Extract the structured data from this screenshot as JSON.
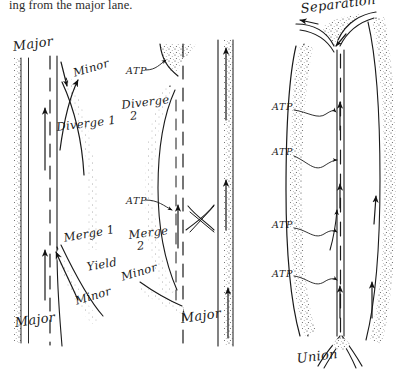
{
  "page": {
    "background_color": "#ffffff",
    "ink_color": "#1a1a1a",
    "caption_text": "ing from the major lane."
  },
  "figure": {
    "title_top_right": "Separation",
    "title_bottom_right": "Union",
    "panels": [
      {
        "id": "panel-left",
        "name": "diverge-merge-1",
        "labels": [
          {
            "name": "label-major-top",
            "text": "Major",
            "x": 12,
            "y": 40
          },
          {
            "name": "label-minor-top",
            "text": "Minor",
            "x": 72,
            "y": 68
          },
          {
            "name": "label-diverge-1",
            "text": "Diverge 1",
            "x": 56,
            "y": 122
          },
          {
            "name": "label-merge-1",
            "text": "Merge 1",
            "x": 63,
            "y": 233
          },
          {
            "name": "label-yield",
            "text": "Yield",
            "x": 86,
            "y": 262
          },
          {
            "name": "label-minor-bottom",
            "text": "Minor",
            "x": 74,
            "y": 296
          },
          {
            "name": "label-major-bottom",
            "text": "Major",
            "x": 14,
            "y": 316
          }
        ]
      },
      {
        "id": "panel-middle",
        "name": "diverge-merge-2",
        "labels": [
          {
            "name": "label-atp-top",
            "text": "ATP",
            "x": 126,
            "y": 66
          },
          {
            "name": "label-diverge-2",
            "text": "Diverge",
            "second_line": "2",
            "x": 121,
            "y": 100
          },
          {
            "name": "label-atp-middle",
            "text": "ATP",
            "x": 126,
            "y": 196
          },
          {
            "name": "label-merge-2",
            "text": "Merge",
            "second_line": "2",
            "x": 128,
            "y": 230
          },
          {
            "name": "label-minor-bottom",
            "text": "Minor",
            "x": 120,
            "y": 272
          },
          {
            "name": "label-major-bottom",
            "text": "Major",
            "x": 180,
            "y": 312
          }
        ]
      },
      {
        "id": "panel-right",
        "name": "separation-union",
        "labels": [
          {
            "name": "label-separation",
            "text": "Separation",
            "x": 300,
            "y": 2
          },
          {
            "name": "label-atp-1",
            "text": "ATP",
            "x": 272,
            "y": 102
          },
          {
            "name": "label-atp-2",
            "text": "ATP",
            "x": 272,
            "y": 147
          },
          {
            "name": "label-atp-3",
            "text": "ATP",
            "x": 272,
            "y": 220
          },
          {
            "name": "label-atp-4",
            "text": "ATP",
            "x": 272,
            "y": 269
          },
          {
            "name": "label-union",
            "text": "Union",
            "x": 296,
            "y": 352
          }
        ]
      }
    ]
  }
}
